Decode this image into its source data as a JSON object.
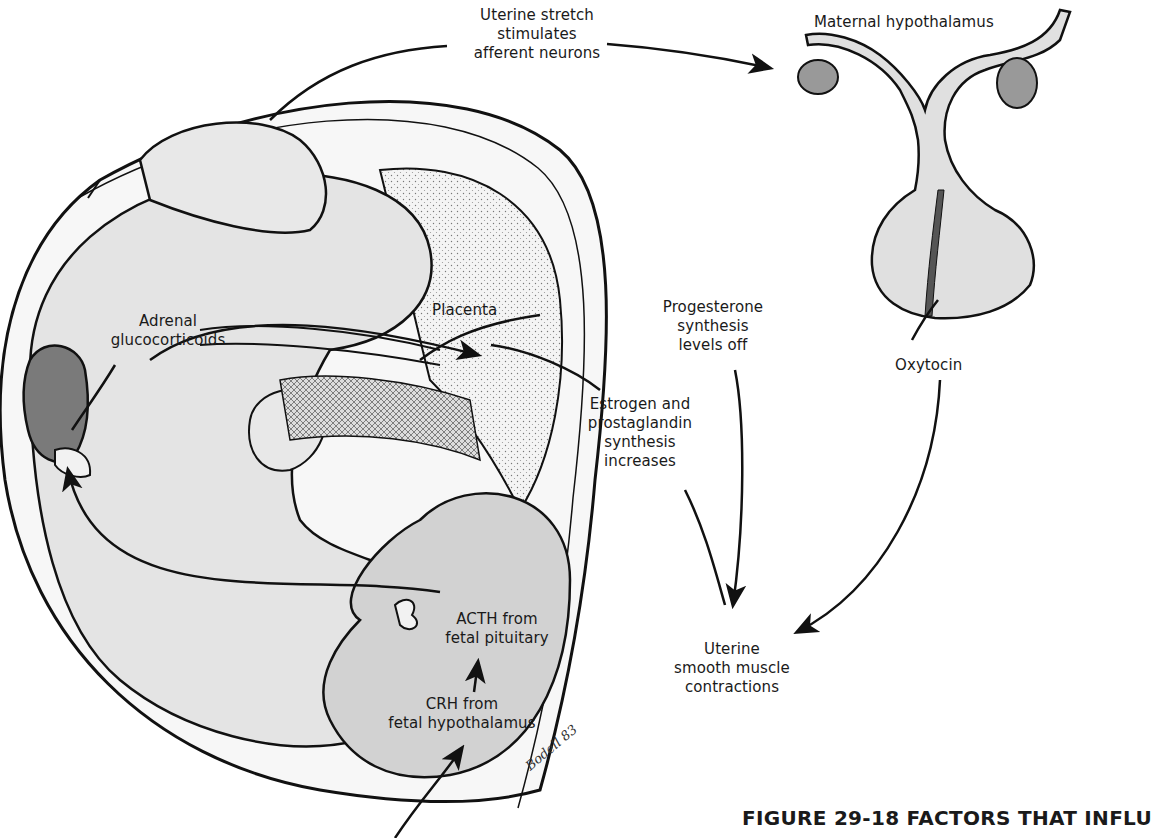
{
  "figure": {
    "caption": "FIGURE 29-18 FACTORS THAT INFLU",
    "signature": "Bodell 83",
    "colors": {
      "background": "#ffffff",
      "fetus_fill": "#e4e4e4",
      "fetal_organ_fill": "#d2d2d2",
      "adrenal_fill": "#7a7a7a",
      "placenta_fill": "#f2f2f2",
      "pituitary_fill": "#e0e0e0",
      "outline": "#111111"
    }
  },
  "labels": {
    "uterine_stretch": [
      "Uterine stretch",
      "stimulates",
      "afferent neurons"
    ],
    "maternal_hypothalamus": "Maternal hypothalamus",
    "placenta": "Placenta",
    "progesterone": [
      "Progesterone",
      "synthesis",
      "levels off"
    ],
    "oxytocin": "Oxytocin",
    "adrenal": [
      "Adrenal",
      "glucocorticoids"
    ],
    "estrogen": [
      "Estrogen and",
      "prostaglandin",
      "synthesis",
      "increases"
    ],
    "acth": [
      "ACTH from",
      "fetal pituitary"
    ],
    "crh": [
      "CRH from",
      "fetal hypothalamus"
    ],
    "contractions": [
      "Uterine",
      "smooth muscle",
      "contractions"
    ]
  },
  "flow": [
    {
      "from": "Uterine stretch",
      "to": "Maternal hypothalamus"
    },
    {
      "from": "Maternal hypothalamus",
      "to": "Oxytocin"
    },
    {
      "from": "Oxytocin",
      "to": "Uterine smooth muscle contractions"
    },
    {
      "from": "CRH from fetal hypothalamus",
      "to": "ACTH from fetal pituitary"
    },
    {
      "from": "ACTH from fetal pituitary",
      "to": "Adrenal glucocorticoids"
    },
    {
      "from": "Adrenal glucocorticoids",
      "to": "Placenta"
    },
    {
      "from": "Placenta",
      "to": "Progesterone synthesis levels off"
    },
    {
      "from": "Placenta",
      "to": "Estrogen and prostaglandin synthesis increases"
    },
    {
      "from": "Progesterone synthesis levels off",
      "to": "Uterine smooth muscle contractions"
    },
    {
      "from": "Estrogen and prostaglandin synthesis increases",
      "to": "Uterine smooth muscle contractions"
    }
  ]
}
